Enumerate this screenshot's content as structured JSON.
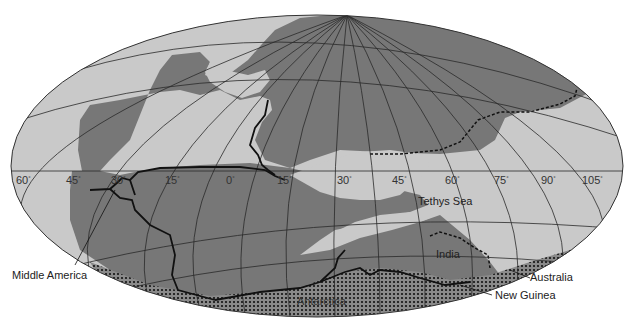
{
  "map": {
    "colors": {
      "ocean": "#c9c9c9",
      "land": "#777777",
      "grid": "#2a2a2a",
      "boundary": "#111111",
      "background": "#ffffff"
    },
    "longitude_labels": [
      {
        "text": "60",
        "x": 16
      },
      {
        "text": "45",
        "x": 66
      },
      {
        "text": "30",
        "x": 111
      },
      {
        "text": "15",
        "x": 165
      },
      {
        "text": "0",
        "x": 226
      },
      {
        "text": "15",
        "x": 277
      },
      {
        "text": "30",
        "x": 337
      },
      {
        "text": "45",
        "x": 392
      },
      {
        "text": "60",
        "x": 445
      },
      {
        "text": "75",
        "x": 494
      },
      {
        "text": "90",
        "x": 541
      },
      {
        "text": "105",
        "x": 582
      }
    ],
    "degree_symbol": "°",
    "labels": {
      "tethys_sea": "Tethys Sea",
      "india": "India",
      "antarctica": "Antarctica",
      "australia": "Australia",
      "new_guinea": "New Guinea",
      "middle_america": "Middle America"
    }
  }
}
